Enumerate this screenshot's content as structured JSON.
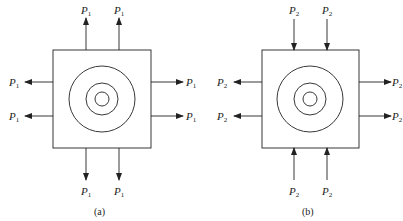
{
  "panels": [
    {
      "caption": "(a)",
      "force_label": "P",
      "force_sub": "1",
      "description": "Square plate with concentric circles; all forces pulling outward (tension)",
      "top": {
        "direction": "outward"
      },
      "bottom": {
        "direction": "outward"
      },
      "left": {
        "direction": "outward"
      },
      "right": {
        "direction": "outward"
      }
    },
    {
      "caption": "(b)",
      "force_label": "P",
      "force_sub": "2",
      "description": "Square plate with concentric circles; vertical forces pushing inward (compression), horizontal forces pulling outward",
      "top": {
        "direction": "inward"
      },
      "bottom": {
        "direction": "inward"
      },
      "left": {
        "direction": "outward"
      },
      "right": {
        "direction": "outward"
      }
    }
  ],
  "colors": {
    "stroke": "#222222",
    "background": "#ffffff"
  }
}
